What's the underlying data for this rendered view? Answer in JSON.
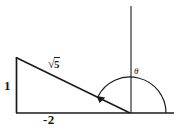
{
  "figure": {
    "type": "geometry-diagram",
    "labels": {
      "vertical_leg": "1",
      "horizontal_leg": "-2",
      "hypotenuse_radical_sign": "√",
      "hypotenuse_radicand": "5",
      "angle": "θ"
    },
    "colors": {
      "stroke": "#1a1a1a",
      "background": "#ffffff",
      "text": "#1a1a1a"
    },
    "geometry": {
      "origin": [
        130,
        113
      ],
      "triangle_apex": [
        16,
        57
      ],
      "triangle_right_angle": [
        16,
        112
      ],
      "vertical_axis": [
        131,
        6,
        131,
        113
      ],
      "horizontal_axis": [
        16,
        113,
        174,
        113
      ],
      "arc_radius": 36,
      "arc_start_degrees": 0,
      "arc_end_degrees": 153
    }
  }
}
